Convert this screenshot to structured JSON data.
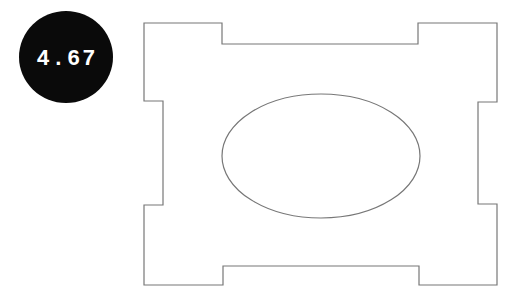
{
  "figure": {
    "badge": {
      "value": "4.67",
      "bg_color": "#0a0a0a",
      "text_color": "#ffffff",
      "shape": "ellipse"
    },
    "shapes": {
      "outline_color": "#777777",
      "large_shape": "notched-rectangle",
      "inner_shape": "ellipse"
    }
  }
}
